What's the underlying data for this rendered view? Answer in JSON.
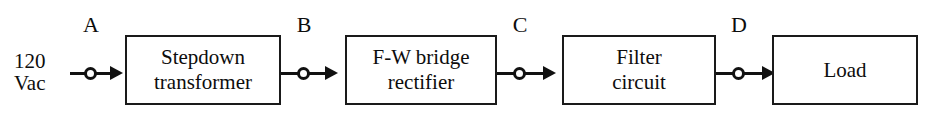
{
  "diagram": {
    "source": {
      "line1": "120",
      "line2": "Vac"
    },
    "blocks": [
      {
        "id": "transformer",
        "label": "Stepdown\ntransformer"
      },
      {
        "id": "rectifier",
        "label": "F-W bridge\nrectifier"
      },
      {
        "id": "filter",
        "label": "Filter\ncircuit"
      },
      {
        "id": "load",
        "label": "Load"
      }
    ],
    "nodes": [
      {
        "id": "a",
        "label": "A"
      },
      {
        "id": "b",
        "label": "B"
      },
      {
        "id": "c",
        "label": "C"
      },
      {
        "id": "d",
        "label": "D"
      }
    ],
    "colors": {
      "stroke": "#111111",
      "box_border": "#1a1a1a",
      "background": "#ffffff",
      "text": "#0d0d0d"
    }
  }
}
